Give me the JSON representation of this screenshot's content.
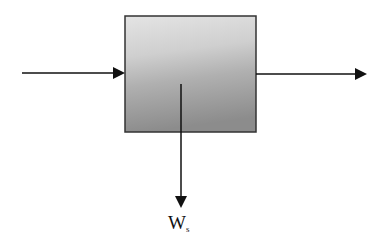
{
  "diagram": {
    "type": "control-volume",
    "process_box": {
      "fill_top": "#dcdcdc",
      "fill_bottom": "#8a8a8a",
      "border": "#333333"
    },
    "arrows": [
      {
        "name": "inlet-stream",
        "direction": "right"
      },
      {
        "name": "outlet-stream",
        "direction": "right"
      },
      {
        "name": "shaft-work",
        "direction": "down"
      }
    ],
    "work_label": {
      "main": "W",
      "subscript": "s"
    }
  }
}
